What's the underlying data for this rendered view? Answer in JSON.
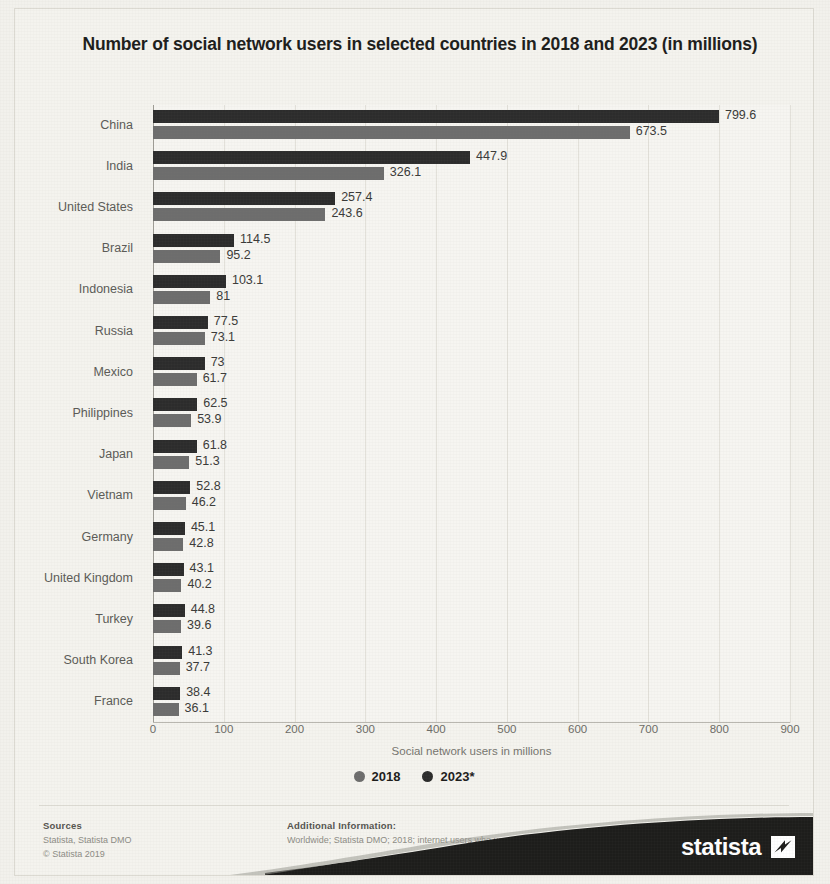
{
  "chart_data": {
    "type": "bar",
    "orientation": "horizontal",
    "title": "Number of social network users in selected countries in 2018 and 2023 (in millions)",
    "xlabel": "Social network users in millions",
    "ylabel": "",
    "xlim": [
      0,
      900
    ],
    "xticks": [
      "0",
      "100",
      "200",
      "300",
      "400",
      "500",
      "600",
      "700",
      "800",
      "900"
    ],
    "grid": true,
    "legend_position": "bottom",
    "categories": [
      "China",
      "India",
      "United States",
      "Brazil",
      "Indonesia",
      "Russia",
      "Mexico",
      "Philippines",
      "Japan",
      "Vietnam",
      "Germany",
      "United Kingdom",
      "Turkey",
      "South Korea",
      "France"
    ],
    "series": [
      {
        "name": "2018",
        "color": "#6d6d6d",
        "values": [
          673.5,
          326.1,
          243.6,
          95.2,
          81,
          73.1,
          61.7,
          53.9,
          51.3,
          46.2,
          42.8,
          40.2,
          39.6,
          37.7,
          36.1
        ],
        "labels": [
          "673.5",
          "326.1",
          "243.6",
          "95.2",
          "81",
          "73.1",
          "61.7",
          "53.9",
          "51.3",
          "46.2",
          "42.8",
          "40.2",
          "39.6",
          "37.7",
          "36.1"
        ]
      },
      {
        "name": "2023*",
        "color": "#2c2c2c",
        "values": [
          799.6,
          447.9,
          257.4,
          114.5,
          103.1,
          77.5,
          73,
          62.5,
          61.8,
          52.8,
          45.1,
          43.1,
          44.8,
          41.3,
          38.4
        ],
        "labels": [
          "799.6",
          "447.9",
          "257.4",
          "114.5",
          "103.1",
          "77.5",
          "73",
          "62.5",
          "61.8",
          "52.8",
          "45.1",
          "43.1",
          "44.8",
          "41.3",
          "38.4"
        ]
      }
    ]
  },
  "legend": [
    {
      "label": "2018",
      "color": "#6d6d6d",
      "dot": "legend-dot-2018"
    },
    {
      "label": "2023*",
      "color": "#2c2c2c",
      "dot": "legend-dot-2023"
    }
  ],
  "footer": {
    "sources_heading": "Sources",
    "sources_line1": "Statista, Statista DMO",
    "sources_line2": "© Statista 2019",
    "info_heading": "Additional Information:",
    "info_line1": "Worldwide; Statista DMO; 2018; internet users who use a social network site at least on"
  },
  "brand": {
    "name": "statista",
    "mark": "statista-arrow-mark"
  }
}
